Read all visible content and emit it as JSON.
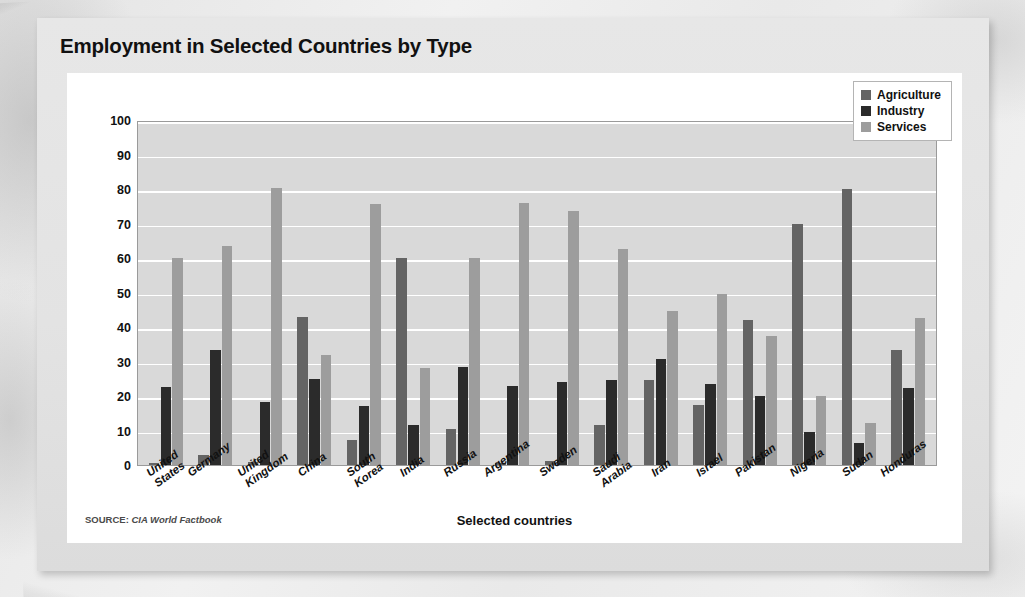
{
  "card": {
    "title": "Employment in Selected Countries by Type",
    "source_kicker": "SOURCE:",
    "source_name": "CIA World Factbook"
  },
  "legend": {
    "position": "top-right",
    "items": [
      {
        "label": "Agriculture",
        "color": "#646464",
        "icon": "legend-swatch-icon"
      },
      {
        "label": "Industry",
        "color": "#2b2b2b",
        "icon": "legend-swatch-icon"
      },
      {
        "label": "Services",
        "color": "#9d9d9d",
        "icon": "legend-swatch-icon"
      }
    ]
  },
  "chart_data": {
    "type": "bar",
    "title": "Employment in Selected Countries by Type",
    "xlabel": "Selected countries",
    "ylabel": "Percent of population",
    "ylim": [
      0,
      100
    ],
    "yticks": [
      100,
      90,
      80,
      70,
      60,
      50,
      40,
      30,
      20,
      10,
      0
    ],
    "grid": true,
    "legend_position": "top-right",
    "categories": [
      "United\nStates",
      "Germany",
      "United\nKingdom",
      "China",
      "South\nKorea",
      "India",
      "Russia",
      "Argentina",
      "Sweden",
      "Saudi\nArabia",
      "Iran",
      "Israel",
      "Pakistan",
      "Nigeria",
      "Sudan",
      "Honduras"
    ],
    "series": [
      {
        "name": "Agriculture",
        "color": "#646464",
        "values": [
          0.6,
          2.8,
          1.0,
          43.0,
          7.2,
          60.0,
          10.5,
          0.5,
          1.1,
          11.5,
          24.6,
          17.5,
          42.0,
          70.0,
          80.0,
          33.4
        ]
      },
      {
        "name": "Industry",
        "color": "#2b2b2b",
        "values": [
          22.6,
          33.4,
          18.2,
          25.0,
          17.0,
          11.7,
          28.5,
          23.0,
          24.0,
          24.6,
          30.6,
          23.4,
          20.0,
          9.7,
          6.3,
          22.3
        ]
      },
      {
        "name": "Services",
        "color": "#9d9d9d",
        "values": [
          60.0,
          63.5,
          80.3,
          32.0,
          75.6,
          28.0,
          60.0,
          76.0,
          73.7,
          62.5,
          44.6,
          49.7,
          37.5,
          20.0,
          12.2,
          42.5
        ]
      }
    ]
  }
}
